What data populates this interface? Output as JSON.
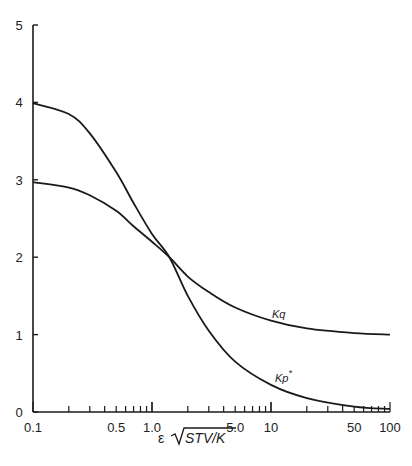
{
  "chart_data": {
    "type": "line",
    "title": "",
    "xlabel": "ε √(STV/K)",
    "ylabel": "",
    "xscale": "log",
    "xlim": [
      0.1,
      100
    ],
    "ylim": [
      0,
      5
    ],
    "grid": false,
    "legend": "none (curves labeled inline)",
    "x_tick_labels": [
      "0.1",
      "0.5",
      "1.0",
      "5.0",
      "10",
      "50",
      "100"
    ],
    "x_tick_values": [
      0.1,
      0.5,
      1.0,
      5.0,
      10,
      50,
      100
    ],
    "y_tick_labels": [
      "0",
      "1",
      "2",
      "3",
      "4",
      "5"
    ],
    "y_tick_values": [
      0,
      1,
      2,
      3,
      4,
      5
    ],
    "x": [
      0.1,
      0.2,
      0.3,
      0.5,
      0.7,
      1.0,
      1.4,
      2.0,
      3.0,
      5.0,
      10,
      20,
      50,
      100
    ],
    "series": [
      {
        "name": "Kq",
        "label": "Kq",
        "values": [
          2.97,
          2.9,
          2.8,
          2.6,
          2.4,
          2.2,
          2.0,
          1.75,
          1.55,
          1.35,
          1.18,
          1.08,
          1.02,
          1.0
        ]
      },
      {
        "name": "Kp*",
        "label": "Kp*",
        "values": [
          3.99,
          3.85,
          3.6,
          3.1,
          2.7,
          2.3,
          2.0,
          1.5,
          1.05,
          0.65,
          0.35,
          0.18,
          0.07,
          0.04
        ]
      }
    ],
    "annotations": [
      {
        "text": "Kq",
        "x": 8,
        "y": 1.3
      },
      {
        "text": "Kp*",
        "x": 8,
        "y": 0.55
      }
    ]
  },
  "labels": {
    "x_axis_prefix": "ε",
    "x_axis_radical": "STV/K",
    "kq": "Kq",
    "kp": "Kp",
    "kp_star": "*"
  },
  "colors": {
    "ink": "#1a1a1a",
    "background": "#ffffff"
  }
}
